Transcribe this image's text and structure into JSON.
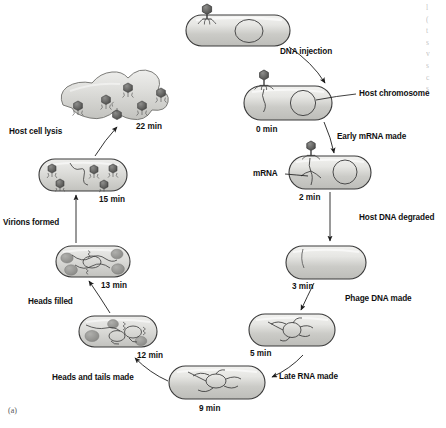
{
  "figure": {
    "panel_id": "(a)",
    "title_semantic": "bacteriophage-lytic-cycle-diagram",
    "colors": {
      "cell_fill_light": "#e8e8e6",
      "cell_fill_mid": "#cfcfcc",
      "cell_outline": "#333333",
      "phage_dark": "#5a5a5a",
      "blob_gray": "#9a9a98",
      "label_text": "#111111"
    },
    "stages": [
      {
        "id": "free-phage-attachment",
        "time_label": "",
        "x": 185,
        "y": 5
      },
      {
        "id": "zero-min",
        "time_label": "0 min",
        "x": 243,
        "y": 85
      },
      {
        "id": "two-min",
        "time_label": "2 min",
        "x": 288,
        "y": 155
      },
      {
        "id": "three-min",
        "time_label": "3 min",
        "x": 285,
        "y": 245
      },
      {
        "id": "five-min",
        "time_label": "5 min",
        "x": 248,
        "y": 313
      },
      {
        "id": "nine-min",
        "time_label": "9 min",
        "x": 168,
        "y": 365
      },
      {
        "id": "twelve-min",
        "time_label": "12 min",
        "x": 78,
        "y": 315
      },
      {
        "id": "thirteen-min",
        "time_label": "13 min",
        "x": 55,
        "y": 245
      },
      {
        "id": "fifteen-min",
        "time_label": "15 min",
        "x": 38,
        "y": 158
      },
      {
        "id": "twentytwo-min",
        "time_label": "22 min",
        "x": 60,
        "y": 65
      }
    ],
    "time_labels": {
      "t0": "0 min",
      "t2": "2 min",
      "t3": "3 min",
      "t5": "5 min",
      "t9": "9 min",
      "t12": "12 min",
      "t13": "13 min",
      "t15": "15 min",
      "t22": "22 min"
    },
    "process_labels": {
      "dna_injection": "DNA injection",
      "host_chromosome": "Host chromosome",
      "early_mrna_made": "Early mRNA made",
      "mrna": "mRNA",
      "host_dna_degraded": "Host DNA degraded",
      "phage_dna_made": "Phage DNA made",
      "late_rna_made": "Late RNA made",
      "heads_and_tails_made": "Heads and tails made",
      "heads_filled": "Heads filled",
      "virions_formed": "Virions formed",
      "host_cell_lysis": "Host cell lysis"
    },
    "margin_text_lines": [
      "l",
      "(",
      "t",
      "s",
      "v",
      "s",
      "c",
      "s",
      "(",
      "t"
    ]
  }
}
